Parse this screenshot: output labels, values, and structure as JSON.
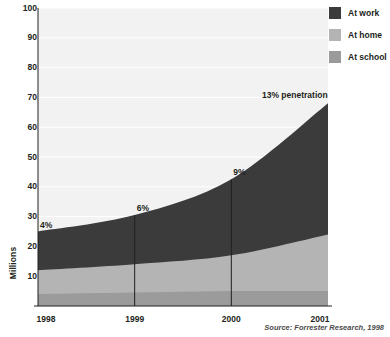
{
  "chart_data": {
    "type": "area",
    "title": "",
    "subtitle": "",
    "xlabel": "",
    "ylabel": "Millions",
    "x": [
      1998,
      1999,
      2000,
      2001
    ],
    "categories": [
      "1998",
      "1999",
      "2000",
      "2001"
    ],
    "xtick_labels": [
      "1998",
      "1999",
      "2000",
      "2001"
    ],
    "ytick_labels": [
      "10",
      "20",
      "30",
      "40",
      "50",
      "60",
      "70",
      "80",
      "90",
      "100"
    ],
    "ytick_values": [
      10,
      20,
      30,
      40,
      50,
      60,
      70,
      80,
      90,
      100
    ],
    "ylim": [
      0,
      100
    ],
    "xlim": [
      1998,
      2001
    ],
    "stacked": true,
    "grid": true,
    "grid_axis": "y",
    "legend_position": "top-right",
    "series": [
      {
        "name": "At work",
        "color": "#3b3b3b",
        "values": [
          13.0,
          16.5,
          25.5,
          44.0
        ]
      },
      {
        "name": "At home",
        "color": "#b4b4b4",
        "values": [
          8.0,
          9.5,
          12.0,
          19.0
        ]
      },
      {
        "name": "At school",
        "color": "#9b9b9b",
        "values": [
          4.0,
          4.5,
          5.0,
          5.0
        ]
      }
    ],
    "cumulative_tops": {
      "at_school": [
        4.0,
        4.5,
        5.0,
        5.0
      ],
      "at_home": [
        12.0,
        14.0,
        17.0,
        24.0
      ],
      "at_work": [
        25.0,
        30.5,
        42.5,
        68.0
      ]
    },
    "totals": [
      25.0,
      30.5,
      42.5,
      68.0
    ],
    "annotations": [
      {
        "text": "4%",
        "x": 1998,
        "value": 25.0,
        "has_marker_line": false
      },
      {
        "text": "6%",
        "x": 1999,
        "value": 30.5,
        "has_marker_line": true
      },
      {
        "text": "9%",
        "x": 2000,
        "value": 42.5,
        "has_marker_line": true
      },
      {
        "text": "13% penetration",
        "x": 2001,
        "value": 68.0,
        "has_marker_line": false
      }
    ],
    "source": "Source: Forrester Research, 1998"
  },
  "legend": {
    "items": [
      {
        "label": "At work"
      },
      {
        "label": "At home"
      },
      {
        "label": "At school"
      }
    ]
  },
  "colors": {
    "at_work": "#3b3b3b",
    "at_home": "#b4b4b4",
    "at_school": "#9b9b9b",
    "plot_background": "#f2f2f2",
    "gridline": "#ffffff",
    "axis": "#231f20",
    "text": "#231f20",
    "source_text": "#4a4a4a"
  }
}
